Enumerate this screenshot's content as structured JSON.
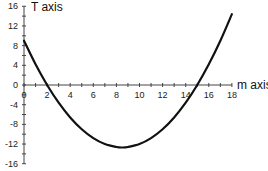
{
  "chart_data": {
    "type": "line",
    "title": "",
    "xlabel": "m axis",
    "ylabel": "T axis",
    "xlim": [
      0,
      18
    ],
    "ylim": [
      -16,
      16
    ],
    "x_ticks": [
      0,
      2,
      4,
      6,
      8,
      10,
      12,
      14,
      16,
      18
    ],
    "x_tick_labels": [
      "0",
      "2",
      "4",
      "6",
      "8",
      "10",
      "12",
      "14",
      "16",
      "18"
    ],
    "y_ticks": [
      16,
      12,
      8,
      4,
      0,
      -4,
      -8,
      -12,
      -16
    ],
    "y_tick_labels": [
      "16",
      "12",
      "8",
      "4",
      "0",
      "-4",
      "-8",
      "-12",
      "-16"
    ],
    "grid": false,
    "legend": null,
    "series": [
      {
        "name": "T(m)",
        "color": "#111111",
        "x": [
          0,
          1,
          2,
          3,
          4,
          5,
          6,
          7,
          8,
          8.5,
          9,
          10,
          11,
          12,
          13,
          14,
          15,
          16,
          17,
          18
        ],
        "y": [
          9.0,
          4.2,
          0.0,
          -3.6,
          -6.6,
          -9.0,
          -10.8,
          -12.0,
          -12.6,
          -12.7,
          -12.6,
          -12.0,
          -10.8,
          -9.0,
          -6.6,
          -3.6,
          0.0,
          4.2,
          9.0,
          14.4
        ]
      }
    ]
  },
  "axes": {
    "x_title": "m axis",
    "y_title": "T axis"
  }
}
